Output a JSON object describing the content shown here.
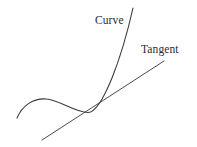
{
  "figure": {
    "type": "math-diagram",
    "background_color": "#ffffff",
    "stroke_color": "#3a3a3a",
    "text_color": "#2b2b2b",
    "stroke_width": 1.1,
    "width": 197,
    "height": 147
  },
  "labels": {
    "curve": "Curve",
    "tangent": "Tangent"
  },
  "geometry": {
    "curve": {
      "name": "curve-path",
      "start_point": [
        17,
        118
      ],
      "hump_peak": [
        45,
        99
      ],
      "trough": [
        88,
        112
      ],
      "tangency_point": [
        97,
        110
      ],
      "end_point": [
        133,
        8
      ],
      "path": "M 17 118 C 22 106, 33 98, 46 99 C 60 100, 74 112, 88 112.5 C 95 112.6, 103 100, 112 78 C 120 58, 128 30, 133 8"
    },
    "tangent_line": {
      "name": "tangent-path",
      "start_point": [
        42,
        140
      ],
      "end_point": [
        164,
        61
      ],
      "path": "M 42 140 L 164 61",
      "touches_curve_at": [
        97,
        110
      ]
    }
  }
}
